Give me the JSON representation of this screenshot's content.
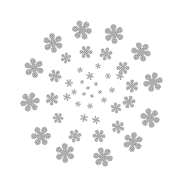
{
  "image": {
    "description": "Snowflakes arranged in a radial burst pattern, shrinking toward the center",
    "background": "#ffffff",
    "flake_color": "#9a9a9a",
    "flake_fill_pattern": "dotted-halftone"
  },
  "flakes": [
    {
      "x": 53,
      "y": 43,
      "r": 9
    },
    {
      "x": 82,
      "y": 30,
      "r": 9
    },
    {
      "x": 114,
      "y": 34,
      "r": 9
    },
    {
      "x": 141,
      "y": 52,
      "r": 9
    },
    {
      "x": 86,
      "y": 52,
      "r": 6
    },
    {
      "x": 106,
      "y": 54,
      "r": 6
    },
    {
      "x": 66,
      "y": 58,
      "r": 5
    },
    {
      "x": 34,
      "y": 68,
      "r": 9
    },
    {
      "x": 55,
      "y": 76,
      "r": 6
    },
    {
      "x": 69,
      "y": 83,
      "r": 4
    },
    {
      "x": 90,
      "y": 76,
      "r": 4
    },
    {
      "x": 123,
      "y": 68,
      "r": 6
    },
    {
      "x": 153,
      "y": 82,
      "r": 9
    },
    {
      "x": 132,
      "y": 86,
      "r": 6
    },
    {
      "x": 30,
      "y": 102,
      "r": 9
    },
    {
      "x": 52,
      "y": 99,
      "r": 6
    },
    {
      "x": 67,
      "y": 97,
      "r": 4
    },
    {
      "x": 116,
      "y": 108,
      "r": 5
    },
    {
      "x": 129,
      "y": 102,
      "r": 6
    },
    {
      "x": 150,
      "y": 118,
      "r": 9
    },
    {
      "x": 41,
      "y": 136,
      "r": 9
    },
    {
      "x": 75,
      "y": 136,
      "r": 6
    },
    {
      "x": 99,
      "y": 136,
      "r": 6
    },
    {
      "x": 118,
      "y": 127,
      "r": 6
    },
    {
      "x": 133,
      "y": 142,
      "r": 9
    },
    {
      "x": 65,
      "y": 153,
      "r": 9
    },
    {
      "x": 103,
      "y": 157,
      "r": 9
    },
    {
      "x": 80,
      "y": 70,
      "r": 3
    },
    {
      "x": 98,
      "y": 66,
      "r": 3
    },
    {
      "x": 108,
      "y": 76,
      "r": 3
    },
    {
      "x": 112,
      "y": 90,
      "r": 3
    },
    {
      "x": 104,
      "y": 100,
      "r": 3
    },
    {
      "x": 90,
      "y": 106,
      "r": 3
    },
    {
      "x": 78,
      "y": 104,
      "r": 3
    },
    {
      "x": 74,
      "y": 92,
      "r": 3
    },
    {
      "x": 84,
      "y": 118,
      "r": 4
    },
    {
      "x": 58,
      "y": 118,
      "r": 5
    },
    {
      "x": 96,
      "y": 120,
      "r": 4
    },
    {
      "x": 120,
      "y": 76,
      "r": 4
    },
    {
      "x": 88,
      "y": 88,
      "r": 2
    },
    {
      "x": 96,
      "y": 84,
      "r": 2
    },
    {
      "x": 100,
      "y": 92,
      "r": 2
    },
    {
      "x": 92,
      "y": 96,
      "r": 2
    },
    {
      "x": 84,
      "y": 94,
      "r": 2
    },
    {
      "x": 82,
      "y": 82,
      "r": 2
    }
  ]
}
